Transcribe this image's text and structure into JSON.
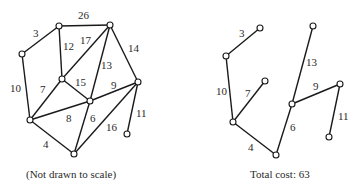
{
  "left_graph": {
    "caption": "(Not drawn to scale)",
    "nodes": [
      {
        "id": "A",
        "x": 22,
        "y": 54
      },
      {
        "id": "B",
        "x": 59,
        "y": 26
      },
      {
        "id": "C",
        "x": 110,
        "y": 25
      },
      {
        "id": "D",
        "x": 62,
        "y": 79
      },
      {
        "id": "E",
        "x": 90,
        "y": 101
      },
      {
        "id": "F",
        "x": 138,
        "y": 82
      },
      {
        "id": "G",
        "x": 30,
        "y": 120
      },
      {
        "id": "H",
        "x": 74,
        "y": 154
      },
      {
        "id": "I",
        "x": 127,
        "y": 134
      }
    ],
    "edges": [
      {
        "from": "A",
        "to": "B",
        "weight": "3",
        "lx": 33,
        "ly": 37
      },
      {
        "from": "B",
        "to": "C",
        "weight": "26",
        "lx": 78,
        "ly": 19
      },
      {
        "from": "B",
        "to": "D",
        "weight": "12",
        "lx": 63,
        "ly": 50
      },
      {
        "from": "C",
        "to": "D",
        "weight": "17",
        "lx": 80,
        "ly": 44
      },
      {
        "from": "C",
        "to": "E",
        "weight": "13",
        "lx": 101,
        "ly": 69
      },
      {
        "from": "C",
        "to": "F",
        "weight": "14",
        "lx": 128,
        "ly": 52
      },
      {
        "from": "A",
        "to": "G",
        "weight": "10",
        "lx": 10,
        "ly": 92
      },
      {
        "from": "D",
        "to": "E",
        "weight": "15",
        "lx": 75,
        "ly": 86
      },
      {
        "from": "D",
        "to": "G",
        "weight": "7",
        "lx": 40,
        "ly": 93
      },
      {
        "from": "E",
        "to": "F",
        "weight": "9",
        "lx": 111,
        "ly": 89
      },
      {
        "from": "G",
        "to": "E",
        "weight": "8",
        "lx": 66,
        "ly": 122
      },
      {
        "from": "E",
        "to": "H",
        "weight": "6",
        "lx": 90,
        "ly": 122
      },
      {
        "from": "F",
        "to": "H",
        "weight": "16",
        "lx": 106,
        "ly": 131
      },
      {
        "from": "F",
        "to": "I",
        "weight": "11",
        "lx": 136,
        "ly": 117
      },
      {
        "from": "G",
        "to": "H",
        "weight": "4",
        "lx": 43,
        "ly": 148
      }
    ]
  },
  "right_tree": {
    "caption": "Total cost: 63",
    "nodes": [
      {
        "id": "a",
        "x": 226,
        "y": 56
      },
      {
        "id": "b",
        "x": 260,
        "y": 28
      },
      {
        "id": "c",
        "x": 233,
        "y": 122
      },
      {
        "id": "d",
        "x": 265,
        "y": 81
      },
      {
        "id": "e",
        "x": 276,
        "y": 155
      },
      {
        "id": "f",
        "x": 292,
        "y": 104
      },
      {
        "id": "g",
        "x": 313,
        "y": 26
      },
      {
        "id": "h",
        "x": 340,
        "y": 84
      },
      {
        "id": "i",
        "x": 329,
        "y": 137
      }
    ],
    "edges": [
      {
        "from": "a",
        "to": "b",
        "weight": "3",
        "lx": 239,
        "ly": 37
      },
      {
        "from": "a",
        "to": "c",
        "weight": "10",
        "lx": 216,
        "ly": 95
      },
      {
        "from": "c",
        "to": "d",
        "weight": "7",
        "lx": 245,
        "ly": 97
      },
      {
        "from": "c",
        "to": "e",
        "weight": "4",
        "lx": 248,
        "ly": 151
      },
      {
        "from": "e",
        "to": "f",
        "weight": "6",
        "lx": 290,
        "ly": 131
      },
      {
        "from": "f",
        "to": "g",
        "weight": "13",
        "lx": 306,
        "ly": 66
      },
      {
        "from": "f",
        "to": "h",
        "weight": "9",
        "lx": 313,
        "ly": 90
      },
      {
        "from": "h",
        "to": "i",
        "weight": "11",
        "lx": 338,
        "ly": 120
      }
    ]
  }
}
